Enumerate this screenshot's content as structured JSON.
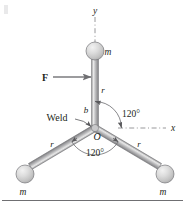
{
  "figure": {
    "background_color": "#ffffff",
    "rod_color": "#8e8e90",
    "ball_color": "#d9d9d9",
    "ink_color": "#231f20",
    "axis_style": "dash-dot",
    "hub": {
      "x": 95,
      "y": 128
    },
    "labels": {
      "axis_y": "y",
      "axis_x": "x",
      "force": "F",
      "mass_top": "m",
      "mass_left": "m",
      "mass_right": "m",
      "radius_top": "r",
      "radius_left": "r",
      "radius_right": "r",
      "weld": "Weld",
      "small_b": "b",
      "origin": "O",
      "angle_upper": "120°",
      "angle_lower": "120°"
    },
    "masses": [
      {
        "name": "mass-top",
        "label": "m",
        "cx": 95,
        "cy": 51,
        "r": 9
      },
      {
        "name": "mass-left",
        "label": "m",
        "cx": 25,
        "cy": 174,
        "r": 9
      },
      {
        "name": "mass-right",
        "label": "m",
        "cx": 165,
        "cy": 174,
        "r": 9
      }
    ],
    "arms": [
      {
        "name": "arm-top",
        "length_label": "r"
      },
      {
        "name": "arm-left",
        "length_label": "r"
      },
      {
        "name": "arm-right",
        "length_label": "r"
      }
    ],
    "angles": [
      {
        "name": "angle-upper-right",
        "value": "120°"
      },
      {
        "name": "angle-lower",
        "value": "120°"
      }
    ],
    "baseline_rule": true
  }
}
